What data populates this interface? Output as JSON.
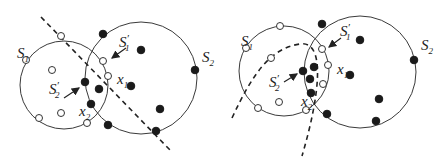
{
  "panels": [
    {
      "id": "left",
      "separator": "linear",
      "circles": [
        {
          "name": "S1",
          "cx": 64,
          "cy": 85,
          "r": 44
        },
        {
          "name": "S2",
          "cx": 141,
          "cy": 78,
          "r": 56
        }
      ],
      "separator_path": "M41,17 L170,150",
      "open_points": [
        [
          61,
          36
        ],
        [
          26,
          60
        ],
        [
          52,
          70
        ],
        [
          103,
          61
        ],
        [
          108,
          76
        ],
        [
          61,
          113
        ],
        [
          39,
          118
        ],
        [
          87,
          123
        ]
      ],
      "filled_points": [
        [
          103,
          34
        ],
        [
          141,
          50
        ],
        [
          195,
          70
        ],
        [
          85,
          82
        ],
        [
          99,
          89
        ],
        [
          131,
          86
        ],
        [
          91,
          104
        ],
        [
          160,
          109
        ],
        [
          108,
          125
        ],
        [
          156,
          131
        ]
      ],
      "labels": {
        "S1": {
          "main": "S",
          "sub": "1",
          "x": 17,
          "y": 58
        },
        "S2": {
          "main": "S",
          "sub": "2",
          "x": 202,
          "y": 62
        },
        "S1p": {
          "main": "S",
          "sup": "′",
          "sub": "1",
          "x": 119,
          "y": 47
        },
        "x1": {
          "main": "x",
          "sub": "1",
          "x": 117,
          "y": 84
        },
        "S2p": {
          "main": "S",
          "sup": "′",
          "sub": "2",
          "x": 49,
          "y": 94
        },
        "x2": {
          "main": "x",
          "sub": "2",
          "x": 79,
          "y": 116
        }
      }
    },
    {
      "id": "right",
      "separator": "nonlinear",
      "circles": [
        {
          "name": "S1",
          "cx": 284,
          "cy": 71,
          "r": 45
        },
        {
          "name": "S2",
          "cx": 360,
          "cy": 72,
          "r": 56
        }
      ],
      "separator_path": "M232,118 C252,75 270,48 300,44 C326,40 320,95 302,156",
      "open_points": [
        [
          280,
          26
        ],
        [
          246,
          48
        ],
        [
          271,
          58
        ],
        [
          322,
          49
        ],
        [
          328,
          65
        ],
        [
          279,
          102
        ],
        [
          258,
          108
        ],
        [
          306,
          110
        ],
        [
          323,
          84
        ]
      ],
      "filled_points": [
        [
          322,
          24
        ],
        [
          360,
          40
        ],
        [
          414,
          60
        ],
        [
          303,
          71
        ],
        [
          314,
          67
        ],
        [
          310,
          79
        ],
        [
          350,
          75
        ],
        [
          379,
          99
        ],
        [
          311,
          93
        ],
        [
          327,
          114
        ],
        [
          376,
          121
        ]
      ],
      "labels": {
        "S1": {
          "main": "S",
          "sub": "1",
          "x": 241,
          "y": 46
        },
        "S2": {
          "main": "S",
          "sub": "2",
          "x": 421,
          "y": 50
        },
        "S1p": {
          "main": "S",
          "sup": "′",
          "sub": "1",
          "x": 340,
          "y": 36
        },
        "x1": {
          "main": "x",
          "sub": "1",
          "x": 337,
          "y": 74
        },
        "S2p": {
          "main": "S",
          "sup": "′",
          "sub": "2",
          "x": 269,
          "y": 87
        },
        "x2": {
          "main": "x",
          "sub": "2",
          "x": 301,
          "y": 106
        }
      }
    }
  ]
}
